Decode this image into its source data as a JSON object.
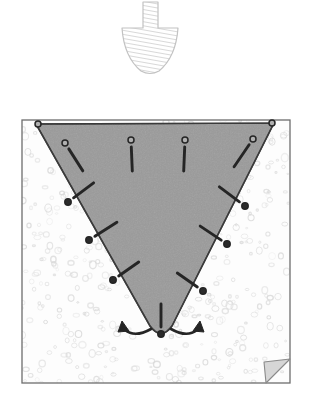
{
  "figure": {
    "width": 313,
    "height": 403,
    "background_color": "#ffffff"
  },
  "colors": {
    "wedge_fill": "#9a9a9a",
    "wedge_stroke": "#3a3a3a",
    "soil_fill": "#fdfdfd",
    "soil_speckle": "#d8d8d8",
    "box_stroke": "#6d6d6d",
    "arrow_fill": "#ffffff",
    "arrow_stroke": "#c2c2c2",
    "arrow_hatch": "#c8c8c8",
    "marker_fill": "#2b2b2b",
    "marker_open_fill": "#b0b0b0",
    "vector_stroke": "#252525",
    "fold_fill": "#d6d6d6",
    "fold_stroke": "#8a8a8a"
  },
  "load_arrow": {
    "name": "applied-load-arrow",
    "shaft": {
      "x": 143,
      "y": 2,
      "width": 15,
      "height": 28
    },
    "head": {
      "left_x": 122,
      "right_x": 178,
      "top_y": 28,
      "tip_x": 150,
      "tip_y": 73
    },
    "hatch_spacing": 4,
    "direction": "down"
  },
  "soil_box": {
    "name": "soil-domain-box",
    "x": 22,
    "y": 120,
    "width": 268,
    "height": 263,
    "fold_corner": {
      "x": 266,
      "y": 359,
      "size": 24
    }
  },
  "wedge": {
    "name": "failure-wedge",
    "top_left": {
      "x": 36,
      "y": 124
    },
    "top_right": {
      "x": 274,
      "y": 123
    },
    "apex_left": {
      "x": 150,
      "y": 326
    },
    "apex_right": {
      "x": 172,
      "y": 326
    },
    "apex_tip": {
      "x": 161,
      "y": 333
    }
  },
  "markers": [
    {
      "id": "m-tl-corner",
      "type": "open",
      "cx": 38,
      "cy": 124,
      "vx": 0,
      "vy": 0,
      "has_vector": false
    },
    {
      "id": "m-tr-corner",
      "type": "open",
      "cx": 272,
      "cy": 123,
      "vx": 0,
      "vy": 0,
      "has_vector": false
    },
    {
      "id": "m-top-1",
      "type": "open",
      "cx": 65,
      "cy": 143,
      "vx": 14,
      "vy": 22,
      "has_vector": true
    },
    {
      "id": "m-top-2",
      "type": "open",
      "cx": 131,
      "cy": 140,
      "vx": 1,
      "vy": 24,
      "has_vector": true
    },
    {
      "id": "m-top-3",
      "type": "open",
      "cx": 185,
      "cy": 140,
      "vx": -1,
      "vy": 24,
      "has_vector": true
    },
    {
      "id": "m-top-4",
      "type": "open",
      "cx": 253,
      "cy": 139,
      "vx": -15,
      "vy": 22,
      "has_vector": true
    },
    {
      "id": "m-left-1",
      "type": "filled",
      "cx": 68,
      "cy": 202,
      "vx": 20,
      "vy": -15,
      "has_vector": true
    },
    {
      "id": "m-left-2",
      "type": "filled",
      "cx": 89,
      "cy": 240,
      "vx": 22,
      "vy": -14,
      "has_vector": true
    },
    {
      "id": "m-left-3",
      "type": "filled",
      "cx": 113,
      "cy": 280,
      "vx": 20,
      "vy": -14,
      "has_vector": true
    },
    {
      "id": "m-right-1",
      "type": "filled",
      "cx": 245,
      "cy": 206,
      "vx": -20,
      "vy": -15,
      "has_vector": true
    },
    {
      "id": "m-right-2",
      "type": "filled",
      "cx": 227,
      "cy": 244,
      "vx": -21,
      "vy": -14,
      "has_vector": true
    },
    {
      "id": "m-right-3",
      "type": "filled",
      "cx": 203,
      "cy": 291,
      "vx": -20,
      "vy": -14,
      "has_vector": true
    },
    {
      "id": "m-apex",
      "type": "filled",
      "cx": 161,
      "cy": 334,
      "vx": 0,
      "vy": -23,
      "has_vector": true
    }
  ],
  "apex_arrows": [
    {
      "id": "apex-arrow-left",
      "name": "apex-curved-arrow-left",
      "direction": "left"
    },
    {
      "id": "apex-arrow-right",
      "name": "apex-curved-arrow-right",
      "direction": "right"
    }
  ],
  "speckles": {
    "seed": 7,
    "count": 520,
    "min_r": 1.0,
    "max_r": 3.6
  }
}
